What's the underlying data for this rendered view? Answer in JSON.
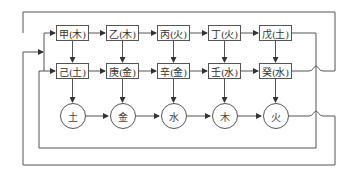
{
  "diagram": {
    "type": "flow",
    "colors": {
      "line": "#555555",
      "text": "#333333",
      "background": "#ffffff"
    },
    "row1": [
      {
        "id": "jia",
        "label": "甲(木)"
      },
      {
        "id": "yi",
        "label": "乙(木)"
      },
      {
        "id": "bing",
        "label": "丙(火)"
      },
      {
        "id": "ding",
        "label": "丁(火)"
      },
      {
        "id": "wu",
        "label": "戊(土)"
      }
    ],
    "row2": [
      {
        "id": "ji",
        "label": "己(土)"
      },
      {
        "id": "geng",
        "label": "庚(金)"
      },
      {
        "id": "xin",
        "label": "辛(金)"
      },
      {
        "id": "ren",
        "label": "壬(水)"
      },
      {
        "id": "gui",
        "label": "癸(水)"
      }
    ],
    "elements": [
      {
        "id": "earth",
        "label": "土"
      },
      {
        "id": "metal",
        "label": "金"
      },
      {
        "id": "water",
        "label": "水"
      },
      {
        "id": "wood",
        "label": "木"
      },
      {
        "id": "fire",
        "label": "火"
      }
    ],
    "edges": [
      "甲(木)→乙(木)",
      "乙(木)→丙(火)",
      "丙(火)→丁(火)",
      "丁(火)→戊(土)",
      "己(土)→庚(金)",
      "庚(金)→辛(金)",
      "辛(金)→壬(水)",
      "壬(水)→癸(水)",
      "甲(木)→己(土)",
      "乙(木)→庚(金)",
      "丙(火)→辛(金)",
      "丁(火)→壬(水)",
      "戊(土)→癸(水)",
      "己(土)→土",
      "庚(金)→金",
      "辛(金)→水",
      "壬(水)→木",
      "癸(水)→火",
      "土→金",
      "金→水",
      "水→木",
      "木→火",
      "癸(水)→甲(木) (feedback loop, top)",
      "戊(土)→己(土) (feedback loop)",
      "火→input bus (feedback loop, bottom)"
    ]
  }
}
